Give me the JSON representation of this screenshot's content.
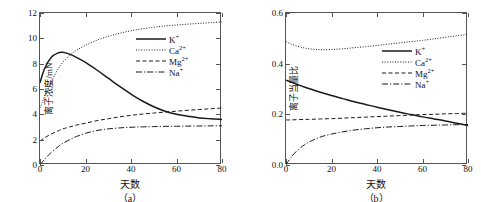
{
  "figure": {
    "panels": [
      {
        "caption": "（a）",
        "xlabel": "天数",
        "ylabel": "离子浓度/mN",
        "xticks": [
          "0",
          "20",
          "40",
          "60",
          "80"
        ],
        "yticks": [
          "0",
          "2",
          "4",
          "6",
          "8",
          "10",
          "12"
        ],
        "legend": [
          {
            "label": "K",
            "sup": "+",
            "style": "solid"
          },
          {
            "label": "Ca",
            "sup": "2+",
            "style": "dotted"
          },
          {
            "label": "Mg",
            "sup": "2+",
            "style": "dashed"
          },
          {
            "label": "Na",
            "sup": "+",
            "style": "dashdot"
          }
        ]
      },
      {
        "caption": "（b）",
        "xlabel": "天数",
        "ylabel": "离子当量比",
        "xticks": [
          "0",
          "20",
          "40",
          "60",
          "80"
        ],
        "yticks": [
          "0.0",
          "0.2",
          "0.4",
          "0.6"
        ],
        "legend": [
          {
            "label": "K",
            "sup": "+",
            "style": "solid"
          },
          {
            "label": "Ca",
            "sup": "2+",
            "style": "dotted"
          },
          {
            "label": "Mg",
            "sup": "2+",
            "style": "dashed"
          },
          {
            "label": "Na",
            "sup": "+",
            "style": "dashdot"
          }
        ]
      }
    ]
  },
  "chart_data": [
    {
      "type": "line",
      "title": "（a）",
      "xlabel": "天数",
      "ylabel": "离子浓度/mN",
      "xlim": [
        0,
        80
      ],
      "ylim": [
        0,
        12
      ],
      "xticks": [
        0,
        20,
        40,
        60,
        80
      ],
      "yticks": [
        0,
        2,
        4,
        6,
        8,
        10,
        12
      ],
      "grid": false,
      "legend_position": "upper-right-inside",
      "x": [
        0,
        2,
        5,
        8,
        10,
        13,
        16,
        20,
        25,
        30,
        35,
        40,
        45,
        50,
        55,
        60,
        65,
        70,
        75,
        80
      ],
      "series": [
        {
          "name": "K+",
          "style": "solid",
          "values": [
            6.5,
            7.6,
            8.5,
            8.85,
            8.9,
            8.75,
            8.5,
            8.1,
            7.5,
            6.85,
            6.2,
            5.6,
            5.05,
            4.6,
            4.25,
            4.0,
            3.85,
            3.72,
            3.65,
            3.6
          ]
        },
        {
          "name": "Ca2+",
          "style": "dotted",
          "values": [
            4.5,
            5.4,
            6.6,
            7.6,
            8.1,
            8.65,
            9.05,
            9.45,
            9.85,
            10.15,
            10.4,
            10.6,
            10.75,
            10.88,
            10.98,
            11.05,
            11.12,
            11.18,
            11.24,
            11.3
          ]
        },
        {
          "name": "Mg2+",
          "style": "dashed",
          "values": [
            1.9,
            2.15,
            2.45,
            2.7,
            2.85,
            3.0,
            3.15,
            3.3,
            3.5,
            3.65,
            3.8,
            3.92,
            4.02,
            4.1,
            4.18,
            4.25,
            4.32,
            4.38,
            4.44,
            4.5
          ]
        },
        {
          "name": "Na+",
          "style": "dashdot",
          "values": [
            0.0,
            0.45,
            1.0,
            1.45,
            1.7,
            2.0,
            2.25,
            2.5,
            2.72,
            2.85,
            2.93,
            2.98,
            3.01,
            3.03,
            3.05,
            3.06,
            3.07,
            3.08,
            3.09,
            3.1
          ]
        }
      ]
    },
    {
      "type": "line",
      "title": "（b）",
      "xlabel": "天数",
      "ylabel": "离子当量比",
      "xlim": [
        0,
        80
      ],
      "ylim": [
        0.0,
        0.6
      ],
      "xticks": [
        0,
        20,
        40,
        60,
        80
      ],
      "yticks": [
        0.0,
        0.2,
        0.4,
        0.6
      ],
      "grid": false,
      "legend_position": "upper-right-inside",
      "x": [
        0,
        2,
        5,
        8,
        10,
        13,
        16,
        20,
        25,
        30,
        35,
        40,
        45,
        50,
        55,
        60,
        65,
        70,
        75,
        80
      ],
      "series": [
        {
          "name": "K+",
          "style": "solid",
          "values": [
            0.335,
            0.328,
            0.318,
            0.308,
            0.302,
            0.293,
            0.285,
            0.274,
            0.262,
            0.25,
            0.239,
            0.228,
            0.218,
            0.208,
            0.199,
            0.19,
            0.182,
            0.174,
            0.165,
            0.156
          ]
        },
        {
          "name": "Ca2+",
          "style": "dotted",
          "values": [
            0.487,
            0.478,
            0.469,
            0.462,
            0.459,
            0.456,
            0.455,
            0.456,
            0.459,
            0.463,
            0.467,
            0.472,
            0.477,
            0.482,
            0.487,
            0.492,
            0.498,
            0.504,
            0.51,
            0.516
          ]
        },
        {
          "name": "Mg2+",
          "style": "dashed",
          "values": [
            0.178,
            0.178,
            0.179,
            0.18,
            0.18,
            0.181,
            0.182,
            0.183,
            0.185,
            0.187,
            0.189,
            0.191,
            0.193,
            0.195,
            0.197,
            0.199,
            0.2,
            0.202,
            0.203,
            0.205
          ]
        },
        {
          "name": "Na+",
          "style": "dashdot",
          "values": [
            0.0,
            0.028,
            0.058,
            0.079,
            0.09,
            0.103,
            0.113,
            0.122,
            0.131,
            0.138,
            0.143,
            0.147,
            0.15,
            0.152,
            0.154,
            0.156,
            0.157,
            0.158,
            0.159,
            0.16
          ]
        }
      ]
    }
  ]
}
